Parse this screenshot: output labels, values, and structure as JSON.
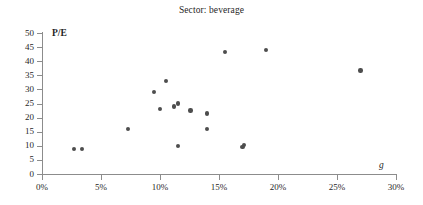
{
  "chart_data": {
    "type": "scatter",
    "title": "Sector: beverage",
    "xlabel": "g",
    "ylabel": "P/E",
    "xlim": [
      0,
      30
    ],
    "ylim": [
      0,
      50
    ],
    "x_tick_labels": [
      "0%",
      "5%",
      "10%",
      "15%",
      "20%",
      "25%",
      "30%"
    ],
    "x_ticks": [
      0,
      5,
      10,
      15,
      20,
      25,
      30
    ],
    "y_tick_labels": [
      "0",
      "5",
      "10",
      "15",
      "20",
      "25",
      "30",
      "35",
      "40",
      "45",
      "50"
    ],
    "y_ticks": [
      0,
      5,
      10,
      15,
      20,
      25,
      30,
      35,
      40,
      45,
      50
    ],
    "grid": false,
    "legend": false,
    "marker_color": "#4d4d4d",
    "axis_color": "#8c8c8c",
    "points": [
      {
        "x": 2.7,
        "y": 8.9
      },
      {
        "x": 3.4,
        "y": 8.9
      },
      {
        "x": 7.3,
        "y": 16.0
      },
      {
        "x": 9.5,
        "y": 29.0
      },
      {
        "x": 10.0,
        "y": 23.0
      },
      {
        "x": 10.5,
        "y": 33.0
      },
      {
        "x": 11.2,
        "y": 24.0
      },
      {
        "x": 11.5,
        "y": 25.0
      },
      {
        "x": 11.5,
        "y": 10.0
      },
      {
        "x": 12.6,
        "y": 22.5
      },
      {
        "x": 14.0,
        "y": 21.5
      },
      {
        "x": 14.0,
        "y": 16.0
      },
      {
        "x": 15.5,
        "y": 43.3
      },
      {
        "x": 17.0,
        "y": 9.6
      },
      {
        "x": 17.1,
        "y": 10.2
      },
      {
        "x": 19.0,
        "y": 44.0
      },
      {
        "x": 27.0,
        "y": 36.7
      }
    ]
  }
}
